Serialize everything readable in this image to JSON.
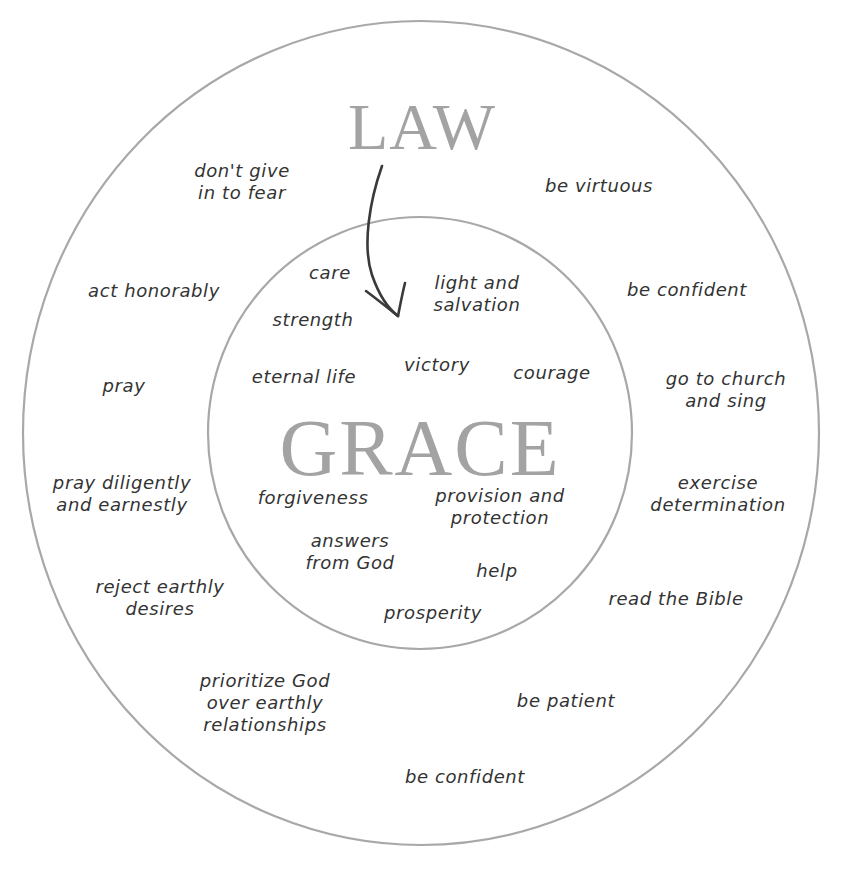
{
  "diagram": {
    "colors": {
      "ring": "#a8a8a8",
      "heading": "#a3a3a3",
      "handwriting": "#333333",
      "arrow": "#3a3a3a",
      "background": "#ffffff"
    },
    "outer_ring": {
      "title": "LAW",
      "items": [
        {
          "id": "dont-give-in",
          "lines": [
            "don't give",
            "in to fear"
          ]
        },
        {
          "id": "be-virtuous",
          "lines": [
            "be virtuous"
          ]
        },
        {
          "id": "act-honorably",
          "lines": [
            "act honorably"
          ]
        },
        {
          "id": "be-confident-1",
          "lines": [
            "be confident"
          ]
        },
        {
          "id": "pray",
          "lines": [
            "pray"
          ]
        },
        {
          "id": "go-to-church",
          "lines": [
            "go to church",
            "and sing"
          ]
        },
        {
          "id": "pray-diligently",
          "lines": [
            "pray diligently",
            "and earnestly"
          ]
        },
        {
          "id": "exercise-determination",
          "lines": [
            "exercise",
            "determination"
          ]
        },
        {
          "id": "reject-earthly",
          "lines": [
            "reject earthly",
            "desires"
          ]
        },
        {
          "id": "read-bible",
          "lines": [
            "read the Bible"
          ]
        },
        {
          "id": "prioritize-god",
          "lines": [
            "prioritize God",
            "over earthly",
            "relationships"
          ]
        },
        {
          "id": "be-patient",
          "lines": [
            "be patient"
          ]
        },
        {
          "id": "be-confident-2",
          "lines": [
            "be confident"
          ]
        }
      ]
    },
    "inner_circle": {
      "title": "GRACE",
      "items": [
        {
          "id": "care",
          "lines": [
            "care"
          ]
        },
        {
          "id": "light-salvation",
          "lines": [
            "light and",
            "salvation"
          ]
        },
        {
          "id": "strength",
          "lines": [
            "strength"
          ]
        },
        {
          "id": "eternal-life",
          "lines": [
            "eternal life"
          ]
        },
        {
          "id": "victory",
          "lines": [
            "victory"
          ]
        },
        {
          "id": "courage",
          "lines": [
            "courage"
          ]
        },
        {
          "id": "forgiveness",
          "lines": [
            "forgiveness"
          ]
        },
        {
          "id": "provision-protection",
          "lines": [
            "provision and",
            "protection"
          ]
        },
        {
          "id": "answers-from-god",
          "lines": [
            "answers",
            "from God"
          ]
        },
        {
          "id": "help",
          "lines": [
            "help"
          ]
        },
        {
          "id": "prosperity",
          "lines": [
            "prosperity"
          ]
        }
      ]
    },
    "arrow": {
      "from": "LAW",
      "to": "GRACE",
      "icon": "curved-down-arrow"
    }
  }
}
